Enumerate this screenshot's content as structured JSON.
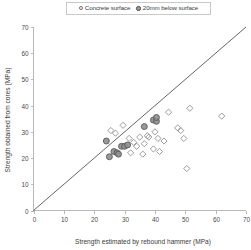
{
  "legend": {
    "position": "top-center",
    "entries": [
      {
        "label": "Concrete surface",
        "marker": "open-circle-icon"
      },
      {
        "label": "20mm below surface",
        "marker": "filled-circle-icon"
      }
    ]
  },
  "chart_data": {
    "type": "scatter",
    "title": "",
    "xlabel": "Strength estimated by rebound hammer (MPa)",
    "ylabel": "Strength obtained from cores (MPa)",
    "xlim": [
      0,
      70
    ],
    "ylim": [
      0,
      70
    ],
    "xticks": [
      0,
      10,
      20,
      30,
      40,
      50,
      60,
      70
    ],
    "yticks": [
      0,
      10,
      20,
      30,
      40,
      50,
      60,
      70
    ],
    "grid": false,
    "annotations": [
      {
        "name": "line-of-equality",
        "type": "line",
        "x": [
          0,
          70
        ],
        "y": [
          0,
          70
        ]
      }
    ],
    "series": [
      {
        "name": "Concrete surface",
        "marker": "open-diamond",
        "color": "#8a8a8a",
        "points": [
          [
            25.5,
            30.5
          ],
          [
            27.0,
            29.5
          ],
          [
            29.5,
            32.5
          ],
          [
            31.5,
            27.5
          ],
          [
            33.0,
            26.0
          ],
          [
            34.0,
            24.5
          ],
          [
            35.0,
            28.0
          ],
          [
            36.5,
            25.5
          ],
          [
            37.5,
            28.5
          ],
          [
            38.0,
            28.0
          ],
          [
            39.5,
            23.5
          ],
          [
            40.0,
            30.0
          ],
          [
            41.0,
            27.5
          ],
          [
            41.5,
            22.5
          ],
          [
            43.0,
            26.5
          ],
          [
            44.5,
            37.5
          ],
          [
            47.5,
            31.5
          ],
          [
            48.5,
            30.5
          ],
          [
            49.5,
            27.5
          ],
          [
            50.5,
            16.0
          ],
          [
            51.5,
            39.0
          ],
          [
            62.0,
            36.0
          ],
          [
            32.0,
            22.0
          ],
          [
            36.0,
            21.5
          ]
        ]
      },
      {
        "name": "20mm below surface",
        "marker": "filled-circle",
        "color": "#8f8f8f",
        "points": [
          [
            24.0,
            26.5
          ],
          [
            26.5,
            22.5
          ],
          [
            27.5,
            22.0
          ],
          [
            29.0,
            24.5
          ],
          [
            30.0,
            24.5
          ],
          [
            31.0,
            25.0
          ],
          [
            25.0,
            20.5
          ],
          [
            36.5,
            32.0
          ],
          [
            39.5,
            34.5
          ],
          [
            40.5,
            34.0
          ],
          [
            40.5,
            35.5
          ],
          [
            28.0,
            21.5
          ]
        ]
      }
    ]
  }
}
